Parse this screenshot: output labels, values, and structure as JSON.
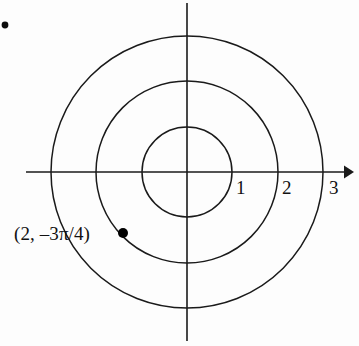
{
  "figure": {
    "kind": "polar-coordinate-grid",
    "background_color": "#fdfdfd",
    "ink_color": "#1a1a1a",
    "width": 359,
    "height": 346
  },
  "axes": {
    "origin": {
      "x": 187,
      "y": 172
    },
    "x_axis": {
      "name": "horizontal-axis",
      "start_x": 26,
      "end_x": 351,
      "y": 172,
      "has_arrow_right": true,
      "has_arrow_left": false
    },
    "y_axis": {
      "name": "vertical-axis",
      "x": 187,
      "start_y": 3,
      "end_y": 341,
      "has_arrow_top": false,
      "has_arrow_bottom": false
    }
  },
  "grid_circles": [
    {
      "label": "1",
      "radius_units": 1,
      "radius_px": 45
    },
    {
      "label": "2",
      "radius_units": 2,
      "radius_px": 91
    },
    {
      "label": "3",
      "radius_units": 3,
      "radius_px": 136
    }
  ],
  "tick_labels": [
    {
      "text": "1",
      "x": 236,
      "y": 178
    },
    {
      "text": "2",
      "x": 282,
      "y": 178
    },
    {
      "text": "3",
      "x": 329,
      "y": 178
    }
  ],
  "plotted_points": [
    {
      "name": "point-2-neg-3pi-over-4",
      "label": "(2, –3π/4)",
      "r": 2,
      "theta": "–3π/4",
      "dot_x": 123,
      "dot_y": 233,
      "dot_radius": 5,
      "label_x": 14,
      "label_y": 224
    }
  ],
  "stray_marks": [
    {
      "name": "stray-dot-top-left",
      "x": 5,
      "y": 25,
      "radius": 3.4
    }
  ]
}
